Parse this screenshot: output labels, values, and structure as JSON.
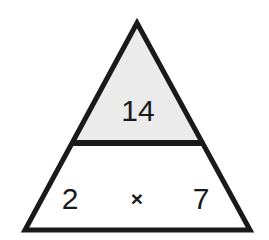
{
  "diagram": {
    "type": "fact-family-triangle",
    "background_color": "#ffffff",
    "stroke_color": "#1a1a1a",
    "stroke_width": 5,
    "divider_stroke_width": 6,
    "top_section": {
      "label": "product",
      "fill_color": "#ebebeb",
      "value": "14"
    },
    "bottom_section": {
      "label": "factors",
      "fill_color": "#ffffff",
      "left_value": "2",
      "operator": "×",
      "right_value": "7"
    },
    "geometry": {
      "apex_x": 137,
      "apex_y": 23,
      "bottom_left_x": 25,
      "bottom_left_y": 230,
      "bottom_right_x": 250,
      "bottom_right_y": 230,
      "divider_y": 143,
      "divider_left_x": 72,
      "divider_right_x": 203
    }
  }
}
